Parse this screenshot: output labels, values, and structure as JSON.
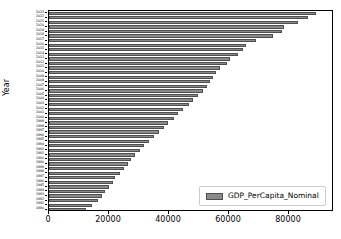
{
  "chart_data": {
    "type": "bar",
    "orientation": "horizontal",
    "title": "",
    "xlabel": "",
    "ylabel": "Year",
    "xlim": [
      0,
      95000
    ],
    "ylim": null,
    "grid": false,
    "xticks": [
      0,
      20000,
      40000,
      60000,
      80000
    ],
    "xtick_labels": [
      "0",
      "20000",
      "40000",
      "60000",
      "80000"
    ],
    "legend": {
      "position": "lower right",
      "entries": [
        {
          "name": "GDP_PerCapita_Nominal",
          "color": "#8a8a8a"
        }
      ]
    },
    "series": [
      {
        "name": "GDP_PerCapita_Nominal",
        "color": "#8a8a8a",
        "edge_color": "#4f4f4f"
      }
    ],
    "categories": [
      "2023",
      "2022",
      "2021",
      "2020",
      "2019",
      "2018",
      "2017",
      "2016",
      "2015",
      "2014",
      "2013",
      "2012",
      "2011",
      "2010",
      "2009",
      "2008",
      "2007",
      "2006",
      "2005",
      "2004",
      "2003",
      "2002",
      "2001",
      "2000",
      "1999",
      "1998",
      "1997",
      "1996",
      "1995",
      "1994",
      "1993",
      "1992",
      "1991",
      "1990",
      "1989",
      "1988",
      "1987",
      "1986",
      "1985",
      "1984",
      "1983",
      "1982",
      "1981",
      "1980"
    ],
    "values": [
      89000,
      86200,
      83000,
      78200,
      77500,
      74800,
      69000,
      65800,
      64500,
      63000,
      60200,
      59200,
      57000,
      55800,
      54500,
      53800,
      52500,
      51200,
      49600,
      48000,
      46500,
      44800,
      43100,
      41500,
      39500,
      38200,
      36800,
      35000,
      33200,
      31500,
      30200,
      28800,
      27200,
      26200,
      25000,
      23600,
      22000,
      21200,
      20000,
      18800,
      17600,
      16200,
      14400,
      12200
    ]
  },
  "figure": {
    "background": "#ffffff",
    "axes_border_color": "#000000"
  }
}
